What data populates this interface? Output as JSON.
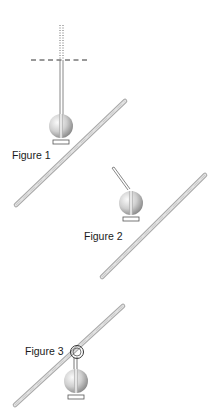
{
  "figures": [
    {
      "label": "Figure 1",
      "description": "Pendulum ball hanging straight down on a vertical string; a dotted vertical reference line continues above a horizontal dashed reference line; an inclined rod lies below-right of the ball",
      "string_angle": "vertical",
      "reference_lines": [
        "vertical-dotted",
        "horizontal-dashed"
      ]
    },
    {
      "label": "Figure 2",
      "description": "Ball with a string angled up-left; inclined rod to the lower right",
      "string_angle": "tilted-left"
    },
    {
      "label": "Figure 3",
      "description": "Ball hanging from a loop threaded around an inclined rod",
      "string_angle": "loop-on-rod"
    }
  ],
  "colors": {
    "rod_light": "#d4d4d4",
    "rod_dark": "#9a9a9a",
    "ball_light": "#f2f2f2",
    "ball_dark": "#8c8c8c",
    "string": "#7a7a7a",
    "reference_line": "#333333",
    "text": "#1a1a1a"
  }
}
